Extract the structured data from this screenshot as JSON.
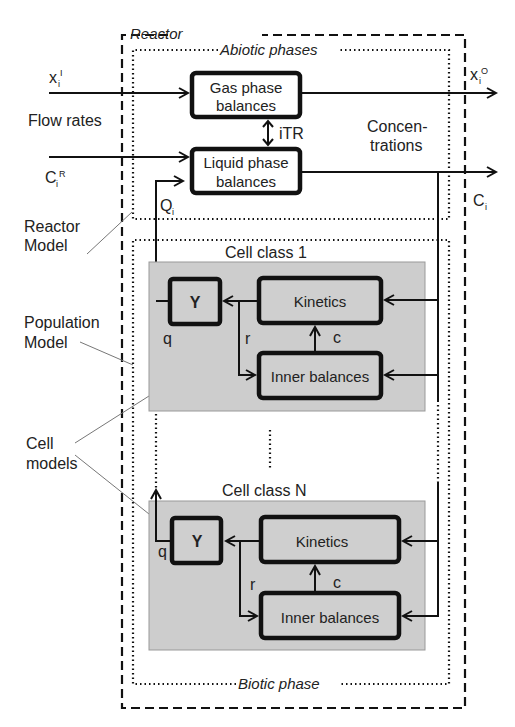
{
  "diagram": {
    "containers": {
      "reactor": "Reactor",
      "abiotic": "Abiotic phases",
      "biotic": "Biotic phase"
    },
    "abiotic_boxes": {
      "gas_line1": "Gas phase",
      "gas_line2": "balances",
      "liquid_line1": "Liquid phase",
      "liquid_line2": "balances"
    },
    "signals": {
      "xi_in": "x",
      "xi_in_sub": "i",
      "xi_in_sup": "I",
      "xi_out": "x",
      "xi_out_sub": "i",
      "xi_out_sup": "O",
      "ci_r": "C",
      "ci_r_sub": "i",
      "ci_r_sup": "R",
      "ci_out": "C",
      "ci_out_sub": "i",
      "qi": "Q",
      "qi_sub": "i",
      "itr": "iTR",
      "q": "q",
      "r": "r",
      "c": "c"
    },
    "side_labels": {
      "flow_rates": "Flow rates",
      "concentrations_line1": "Concen-",
      "concentrations_line2": "trations",
      "reactor_model_line1": "Reactor",
      "reactor_model_line2": "Model",
      "population_model_line1": "Population",
      "population_model_line2": "Model",
      "cell_models_line1": "Cell",
      "cell_models_line2": "models"
    },
    "cell_classes": [
      {
        "title": "Cell class 1",
        "yield": "Y",
        "kinetics": "Kinetics",
        "inner": "Inner balances"
      },
      {
        "title": "Cell class N",
        "yield": "Y",
        "kinetics": "Kinetics",
        "inner": "Inner balances"
      }
    ],
    "ellipsis": "⋮",
    "colors": {
      "cell_fill": "#cdcdcd",
      "stroke": "#111111"
    }
  }
}
